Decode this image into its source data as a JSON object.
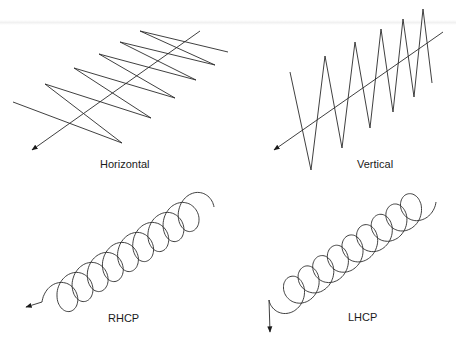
{
  "colors": {
    "stroke": "#2a2a2a",
    "background": "#ffffff"
  },
  "panels": [
    {
      "id": "horizontal",
      "label": "Horizontal",
      "label_pos": [
        100,
        158
      ],
      "type": "zigzag",
      "points": [
        [
          13,
          102
        ],
        [
          122,
          143
        ],
        [
          45,
          84
        ],
        [
          151,
          118
        ],
        [
          74,
          68
        ],
        [
          175,
          98
        ],
        [
          99,
          54
        ],
        [
          196,
          80
        ],
        [
          120,
          42
        ],
        [
          215,
          65
        ],
        [
          140,
          31
        ],
        [
          228,
          52
        ]
      ],
      "axis": {
        "from": [
          200,
          31
        ],
        "to": [
          32,
          150
        ]
      }
    },
    {
      "id": "vertical",
      "label": "Vertical",
      "label_pos": [
        357,
        158
      ],
      "type": "zigzag",
      "points": [
        [
          290,
          72
        ],
        [
          311,
          170
        ],
        [
          325,
          56
        ],
        [
          342,
          148
        ],
        [
          355,
          42
        ],
        [
          370,
          128
        ],
        [
          381,
          29
        ],
        [
          393,
          112
        ],
        [
          403,
          19
        ],
        [
          414,
          97
        ],
        [
          423,
          9
        ],
        [
          432,
          83
        ]
      ],
      "axis": {
        "from": [
          443,
          32
        ],
        "to": [
          274,
          150
        ]
      }
    },
    {
      "id": "rhcp",
      "label": "RHCP",
      "label_pos": [
        108,
        312
      ],
      "type": "helix",
      "handedness": "right",
      "start_center": [
        56,
        302
      ],
      "end_center": [
        200,
        207
      ],
      "turns": 9.5,
      "rx": 14,
      "ry": 17,
      "arrow_at": "start",
      "arrow_tip": [
        26,
        307
      ]
    },
    {
      "id": "lhcp",
      "label": "LHCP",
      "label_pos": [
        348,
        311
      ],
      "type": "helix",
      "handedness": "left",
      "start_center": [
        283,
        300
      ],
      "end_center": [
        422,
        202
      ],
      "turns": 9.5,
      "rx": 14,
      "ry": 16,
      "arrow_at": "start",
      "arrow_tip": [
        270,
        332
      ]
    }
  ]
}
